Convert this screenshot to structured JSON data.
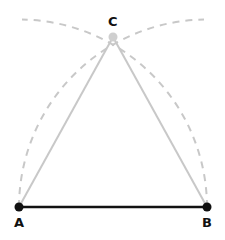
{
  "diagram": {
    "points": {
      "A": {
        "label": "A",
        "x": 19,
        "y": 207
      },
      "B": {
        "label": "B",
        "x": 207,
        "y": 207
      },
      "C": {
        "label": "C",
        "x": 113,
        "y": 37
      }
    },
    "segments": [
      {
        "from": "A",
        "to": "B",
        "style": "solid",
        "color": "#111111"
      },
      {
        "from": "A",
        "to": "C",
        "style": "solid",
        "color": "#c8c8c8"
      },
      {
        "from": "B",
        "to": "C",
        "style": "solid",
        "color": "#c8c8c8"
      }
    ],
    "arcs": [
      {
        "center": "A",
        "radius": 188,
        "style": "dashed",
        "color": "#c8c8c8"
      },
      {
        "center": "B",
        "radius": 188,
        "style": "dashed",
        "color": "#c8c8c8"
      }
    ],
    "colors": {
      "base": "#111111",
      "construction": "#c8c8c8",
      "point_c": "#cfcfcf"
    }
  }
}
